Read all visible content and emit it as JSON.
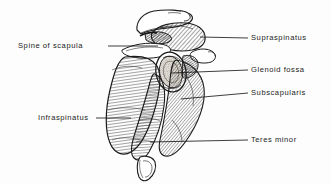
{
  "figure": {
    "view": "lateral-oblique",
    "background_color": "#fdfdfd",
    "ink_color": "#1b1b1b",
    "hatch_color": "#2a2a2a"
  },
  "labels": [
    {
      "id": "spine-of-scapula",
      "text": "Spine of scapula",
      "side": "left",
      "text_x": 18,
      "text_y": 43,
      "leader": {
        "x1": 108,
        "y1": 46,
        "x2": 158,
        "y2": 46
      }
    },
    {
      "id": "supraspinatus",
      "text": "Supraspinatus",
      "side": "right",
      "text_x": 251,
      "text_y": 34,
      "leader": {
        "x1": 200,
        "y1": 37,
        "x2": 248,
        "y2": 38
      }
    },
    {
      "id": "glenoid-fossa",
      "text": "Glenoid fossa",
      "side": "right",
      "text_x": 251,
      "text_y": 66,
      "leader": {
        "x1": 171,
        "y1": 73,
        "x2": 248,
        "y2": 70
      }
    },
    {
      "id": "subscapularis",
      "text": "Subscapularis",
      "side": "right",
      "text_x": 251,
      "text_y": 89,
      "leader": {
        "x1": 181,
        "y1": 99,
        "x2": 248,
        "y2": 93
      }
    },
    {
      "id": "teres-minor",
      "text": "Teres minor",
      "side": "right",
      "text_x": 251,
      "text_y": 136,
      "leader": {
        "x1": 150,
        "y1": 142,
        "x2": 248,
        "y2": 140
      }
    },
    {
      "id": "infraspinatus",
      "text": "Infraspinatus",
      "side": "left",
      "text_x": 38,
      "text_y": 115,
      "leader": {
        "x1": 96,
        "y1": 118,
        "x2": 131,
        "y2": 118
      }
    }
  ],
  "structures": [
    {
      "id": "clavicle-acromion",
      "label": "clavicle and acromion",
      "fill": "white",
      "outline": true
    },
    {
      "id": "supraspinatus-muscle",
      "label": "supraspinatus muscle belly",
      "hatch": "diagonal"
    },
    {
      "id": "glenoid-fossa-cavity",
      "label": "glenoid fossa",
      "texture": "stipple"
    },
    {
      "id": "subscapularis-muscle",
      "label": "subscapularis muscle belly",
      "hatch": "diagonal"
    },
    {
      "id": "infraspinatus-muscle",
      "label": "infraspinatus muscle belly",
      "hatch": "horizontal"
    },
    {
      "id": "teres-minor-muscle",
      "label": "teres minor muscle belly",
      "hatch": "horizontal"
    },
    {
      "id": "inferior-angle",
      "label": "inferior angle of scapula",
      "fill": "white",
      "outline": true
    }
  ]
}
